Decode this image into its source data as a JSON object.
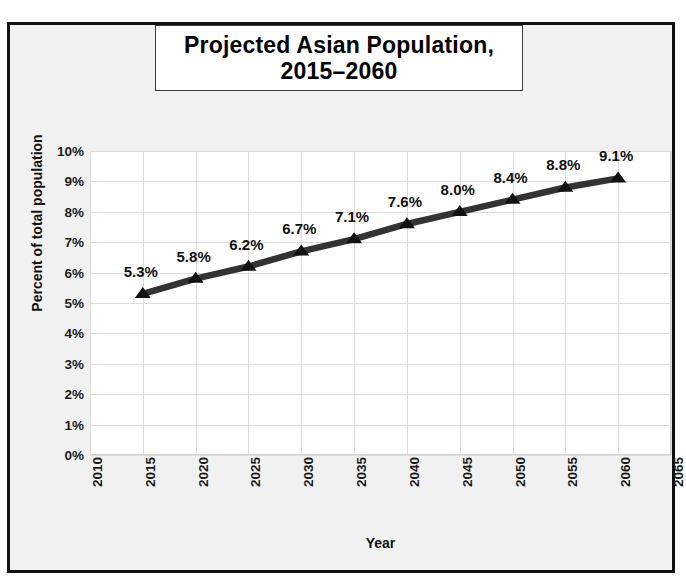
{
  "chart_data": {
    "type": "line",
    "title": "Projected Asian Population, 2015–2060",
    "title_lines": [
      "Projected Asian Population,",
      "2015–2060"
    ],
    "xlabel": "Year",
    "ylabel": "Percent of total population",
    "x": [
      2015,
      2020,
      2025,
      2030,
      2035,
      2040,
      2045,
      2050,
      2055,
      2060
    ],
    "values": [
      5.3,
      5.8,
      6.2,
      6.7,
      7.1,
      7.6,
      8.0,
      8.4,
      8.8,
      9.1
    ],
    "point_labels": [
      "5.3%",
      "5.8%",
      "6.2%",
      "6.7%",
      "7.1%",
      "7.6%",
      "8.0%",
      "8.4%",
      "8.8%",
      "9.1%"
    ],
    "xlim": [
      2010,
      2065
    ],
    "ylim": [
      0,
      10
    ],
    "xticks": [
      2010,
      2015,
      2020,
      2025,
      2030,
      2035,
      2040,
      2045,
      2050,
      2055,
      2060,
      2065
    ],
    "xticklabels": [
      "2010",
      "2015",
      "2020",
      "2025",
      "2030",
      "2035",
      "2040",
      "2045",
      "2050",
      "2055",
      "2060",
      "2065"
    ],
    "yticks": [
      0,
      1,
      2,
      3,
      4,
      5,
      6,
      7,
      8,
      9,
      10
    ],
    "yticklabels": [
      "0%",
      "1%",
      "2%",
      "3%",
      "4%",
      "5%",
      "6%",
      "7%",
      "8%",
      "9%",
      "10%"
    ],
    "grid": true,
    "legend": false,
    "marker": "triangle",
    "series_color": "#333333",
    "grid_color": "#dcdcdc",
    "plot_background": "#ffffff",
    "figure_background": "#f1f1f1",
    "frame_color": "#101010",
    "label_color": "#111111"
  }
}
